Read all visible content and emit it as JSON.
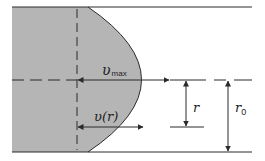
{
  "diagram": {
    "colors": {
      "fill": "#b5b5b5",
      "line": "#2a2a2a",
      "background": "#ffffff"
    },
    "labels": {
      "v_max": {
        "main": "υ",
        "sub": "max"
      },
      "v_r": {
        "text": "υ(r)"
      },
      "r": {
        "text": "r"
      },
      "r0": {
        "main": "r",
        "sub": "0"
      }
    },
    "geometry": {
      "wall_top_y": 7,
      "wall_bottom_y": 152,
      "centerline_y": 80,
      "left_x": 12,
      "right_x": 252,
      "profile_origin_x": 77,
      "profile_start_x": 88,
      "profile_peak_x": 170,
      "v_r_arrow_y": 127,
      "v_r_arrow_end_x": 143,
      "r_arrow_x": 186,
      "r_tick_y": 127,
      "r0_arrow_x": 228
    }
  }
}
